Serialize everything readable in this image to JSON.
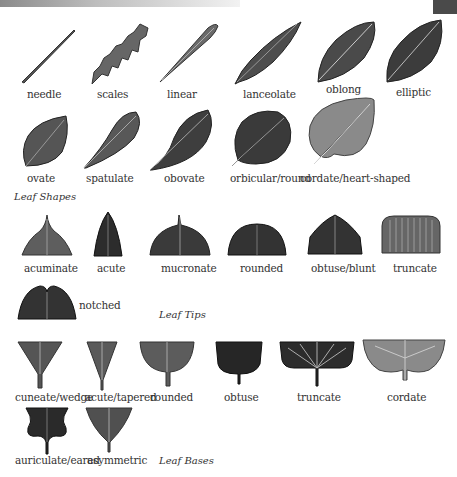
{
  "sections": {
    "shapes": {
      "title": "Leaf Shapes",
      "items": [
        "needle",
        "scales",
        "linear",
        "lanceolate",
        "oblong",
        "elliptic",
        "ovate",
        "spatulate",
        "obovate",
        "orbicular/round",
        "cordate/heart-shaped"
      ]
    },
    "tips": {
      "title": "Leaf Tips",
      "items": [
        "acuminate",
        "acute",
        "mucronate",
        "rounded",
        "obtuse/blunt",
        "truncate",
        "notched"
      ]
    },
    "bases": {
      "title": "Leaf Bases",
      "items": [
        "cuneate/wedge",
        "acute/tapered",
        "rounded",
        "obtuse",
        "truncate",
        "cordate",
        "auriculate/eared",
        "asymmetric"
      ]
    }
  },
  "colors": {
    "leaf_dark": "#2f2f2f",
    "leaf_mid": "#5a5a5a",
    "leaf_light": "#8c8c8c",
    "vein": "#c8c8c8"
  }
}
